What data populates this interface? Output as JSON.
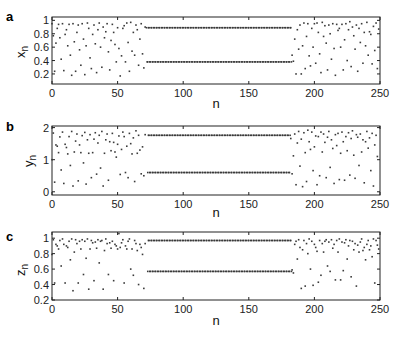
{
  "chart_data": [
    {
      "panel": "a",
      "type": "scatter",
      "ylabel": "x",
      "ylabel_sub": "n",
      "xlabel": "n",
      "xlim": [
        0,
        250
      ],
      "ylim": [
        0.05,
        1.05
      ],
      "xticks": [
        0,
        50,
        100,
        150,
        200,
        250
      ],
      "yticks": [
        0.2,
        0.4,
        0.6,
        0.8,
        1
      ],
      "ytick_labels": [
        "0.2",
        "0.4",
        "0.6",
        "0.8",
        "1"
      ],
      "periodic_window": {
        "start": 72,
        "end": 182,
        "upper": 0.89,
        "lower": 0.38
      },
      "chaotic_low": [
        0.95,
        0.77,
        0.24,
        0.66,
        0.88,
        0.94,
        0.74,
        0.42,
        0.95,
        0.25,
        0.79,
        0.86,
        0.62,
        0.94,
        0.48,
        0.18,
        0.95,
        0.68,
        0.24,
        0.82,
        0.93,
        0.56,
        0.33,
        0.95,
        0.72,
        0.19,
        0.62,
        0.96,
        0.88,
        0.44,
        0.28,
        0.79,
        0.93,
        0.65,
        0.22,
        0.86,
        0.96,
        0.6,
        0.3,
        0.9,
        0.74,
        0.83,
        0.95,
        0.53,
        0.26,
        0.7,
        0.94,
        0.82,
        0.64,
        0.38,
        0.89,
        0.58,
        0.17,
        0.47,
        0.88,
        0.92,
        0.38,
        0.96,
        0.67,
        0.24,
        0.97,
        0.54,
        0.82,
        0.48,
        0.93,
        0.86,
        0.33,
        0.72,
        0.95,
        0.5,
        0.29,
        0.9
      ],
      "chaotic_high": [
        0.48,
        0.39,
        0.72,
        0.2,
        0.86,
        0.57,
        0.93,
        0.2,
        0.62,
        0.96,
        0.28,
        0.76,
        0.95,
        0.47,
        0.32,
        0.88,
        0.6,
        0.95,
        0.36,
        0.96,
        0.82,
        0.5,
        0.22,
        0.97,
        0.76,
        0.92,
        0.66,
        0.26,
        0.93,
        0.8,
        0.42,
        0.95,
        0.58,
        0.18,
        0.94,
        0.85,
        0.88,
        0.6,
        0.94,
        0.26,
        0.71,
        0.95,
        0.4,
        0.86,
        0.98,
        0.31,
        0.9,
        0.77,
        0.57,
        0.93,
        0.24,
        0.88,
        0.67,
        0.95,
        0.36,
        0.82,
        0.62,
        0.97,
        0.48,
        0.83,
        0.79,
        0.35,
        0.91,
        0.55,
        0.96,
        0.28,
        0.87
      ]
    },
    {
      "panel": "b",
      "type": "scatter",
      "ylabel": "y",
      "ylabel_sub": "n",
      "xlabel": "n",
      "xlim": [
        0,
        250
      ],
      "ylim": [
        -0.1,
        2.05
      ],
      "xticks": [
        0,
        50,
        100,
        150,
        200,
        250
      ],
      "yticks": [
        0,
        1,
        2
      ],
      "ytick_labels": [
        "0",
        "1",
        "2"
      ],
      "periodic_window": {
        "start": 73,
        "end": 181,
        "upper": 1.76,
        "lower": 0.6
      },
      "chaotic_low": [
        1.0,
        1.83,
        0.3,
        1.46,
        1.42,
        1.22,
        1.71,
        0.68,
        1.86,
        0.26,
        1.48,
        1.38,
        1.18,
        1.72,
        0.82,
        1.88,
        0.18,
        1.24,
        1.58,
        1.8,
        0.34,
        1.46,
        1.22,
        1.75,
        0.9,
        1.85,
        0.24,
        1.62,
        1.2,
        1.78,
        0.44,
        1.22,
        1.64,
        1.84,
        0.55,
        1.52,
        1.76,
        0.74,
        1.88,
        0.18,
        1.2,
        1.62,
        1.8,
        0.36,
        1.56,
        1.28,
        1.82,
        1.54,
        1.24,
        1.08,
        1.48,
        1.74,
        0.54,
        1.32,
        1.86,
        1.72,
        0.6,
        1.42,
        0.44,
        1.82,
        1.5,
        1.18,
        1.68,
        0.32,
        1.9,
        1.2,
        1.76,
        1.3,
        0.56,
        1.4,
        0.5,
        1.78
      ],
      "chaotic_high": [
        1.66,
        0.56,
        1.12,
        1.8,
        0.22,
        1.52,
        1.88,
        0.8,
        1.64,
        0.16,
        1.84,
        1.22,
        0.32,
        1.92,
        1.56,
        1.32,
        1.86,
        0.66,
        1.4,
        1.74,
        0.22,
        1.72,
        0.5,
        1.86,
        1.24,
        1.8,
        1.54,
        0.44,
        1.7,
        1.88,
        0.76,
        1.62,
        1.35,
        0.26,
        1.78,
        1.44,
        1.82,
        0.38,
        1.2,
        1.86,
        1.56,
        0.36,
        1.72,
        1.28,
        1.84,
        0.52,
        1.66,
        1.9,
        1.14,
        0.42,
        1.78,
        1.7,
        0.82,
        1.8,
        1.24,
        1.62,
        0.28,
        1.56,
        1.88,
        1.36,
        1.68,
        0.66,
        1.82,
        0.18,
        1.46,
        1.76,
        1.1
      ]
    },
    {
      "panel": "c",
      "type": "scatter",
      "ylabel": "z",
      "ylabel_sub": "n",
      "xlabel": "n",
      "xlim": [
        0,
        250
      ],
      "ylim": [
        0.2,
        1.08
      ],
      "xticks": [
        0,
        50,
        100,
        150,
        200,
        250
      ],
      "yticks": [
        0.2,
        0.4,
        0.6,
        0.8,
        1
      ],
      "ytick_labels": [
        "0.2",
        "0.4",
        "0.6",
        "0.8",
        "1"
      ],
      "periodic_window": {
        "start": 73,
        "end": 182,
        "upper": 0.97,
        "lower": 0.57
      },
      "chaotic_low": [
        0.79,
        0.98,
        0.42,
        0.92,
        0.9,
        0.86,
        0.97,
        0.64,
        0.99,
        0.92,
        0.42,
        0.9,
        0.88,
        0.96,
        0.72,
        0.99,
        0.32,
        0.82,
        0.98,
        0.93,
        0.42,
        0.96,
        0.86,
        0.98,
        0.53,
        0.96,
        0.74,
        0.99,
        0.34,
        0.86,
        0.97,
        0.94,
        0.45,
        0.95,
        0.87,
        0.98,
        0.68,
        0.96,
        0.97,
        0.34,
        0.84,
        0.99,
        0.93,
        0.53,
        0.94,
        0.87,
        0.96,
        0.45,
        0.92,
        0.9,
        0.86,
        1.06,
        0.88,
        0.94,
        0.98,
        0.42,
        0.9,
        0.86,
        0.96,
        0.99,
        0.6,
        0.86,
        0.52,
        0.97,
        0.93,
        0.84,
        0.4,
        0.92,
        0.88,
        0.79,
        0.35,
        0.93
      ],
      "chaotic_high": [
        0.59,
        0.55,
        0.92,
        0.96,
        0.73,
        0.98,
        0.88,
        0.35,
        0.85,
        0.97,
        0.38,
        0.93,
        0.8,
        0.99,
        0.6,
        0.96,
        0.39,
        0.92,
        0.88,
        0.83,
        0.43,
        0.97,
        0.52,
        0.93,
        0.82,
        0.96,
        0.98,
        0.64,
        0.95,
        0.57,
        0.98,
        0.87,
        0.92,
        0.46,
        0.97,
        0.82,
        0.99,
        0.46,
        0.95,
        0.58,
        0.94,
        0.98,
        0.73,
        0.9,
        0.97,
        0.5,
        0.96,
        0.85,
        0.93,
        0.38,
        0.91,
        0.82,
        0.95,
        0.99,
        0.84,
        0.88,
        0.72,
        0.92,
        0.97,
        0.85,
        0.9,
        0.76,
        0.99,
        0.42,
        0.97,
        0.91,
        0.86
      ]
    }
  ],
  "panels": {
    "a": {
      "label": "a",
      "ylabel": "x",
      "sub": "n",
      "xlabel": "n"
    },
    "b": {
      "label": "b",
      "ylabel": "y",
      "sub": "n",
      "xlabel": "n"
    },
    "c": {
      "label": "c",
      "ylabel": "z",
      "sub": "n",
      "xlabel": "n"
    }
  },
  "colors": {
    "marker": "#3a3a3a",
    "axis": "#222222",
    "background": "#ffffff"
  }
}
